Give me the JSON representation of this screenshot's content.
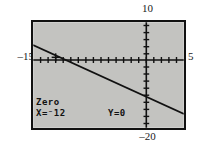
{
  "figure": {
    "type": "graphing-calculator-screenshot"
  },
  "window_labels": {
    "ymax": "10",
    "xmin": "–15",
    "xmax": "5",
    "ymin": "–20"
  },
  "screen": {
    "background_color": "#c3c3c0",
    "border_color": "#111111",
    "ink_color": "#111111"
  },
  "readout": {
    "title": "Zero",
    "x_label": "X=⁻12",
    "y_label": "Y=0"
  },
  "chart_data": {
    "type": "line",
    "title": "Zero",
    "xlabel": "",
    "ylabel": "",
    "xlim": [
      -15,
      5
    ],
    "ylim": [
      -20,
      10
    ],
    "grid": false,
    "legend": "none",
    "axis_tick_spacing": {
      "x": 1,
      "y": 1
    },
    "series": [
      {
        "name": "y = f(x)",
        "x": [
          -15,
          5
        ],
        "y": [
          3.5,
          -16.0
        ],
        "comment": "straight decreasing line crossing the x-axis at x = -12"
      }
    ],
    "annotations": [
      {
        "name": "zero-cursor",
        "x": -12,
        "y": 0,
        "label": "Zero  X=-12  Y=0"
      }
    ]
  }
}
